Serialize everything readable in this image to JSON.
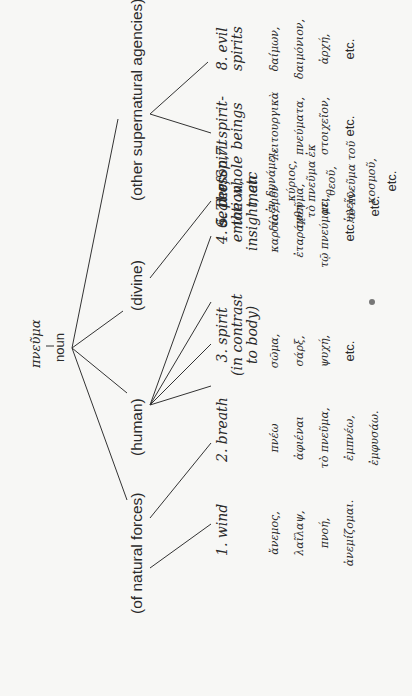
{
  "root": {
    "greek": "πνεῦμα",
    "pos": "noun"
  },
  "groups": [
    {
      "label": "(of natural forces)"
    },
    {
      "label": "(human)"
    },
    {
      "label": "(divine)"
    },
    {
      "label": "(other supernatural agencies)"
    }
  ],
  "categories": [
    {
      "label": "1. wind",
      "words": [
        "ἄνεμος,",
        "λαῖλαψ,",
        "πνοή,",
        "ἀνεμίζομαι."
      ]
    },
    {
      "label": "2. breath",
      "words": [
        "πνέω",
        "ἀφιέναι",
        "τὸ πνεῦμα,",
        "ἐμπνέω,",
        "ἐμφυσάω."
      ]
    },
    {
      "label": "3. spirit (in contrast to body)",
      "lines": [
        "3. spirit",
        "(in contrast",
        "to body)"
      ],
      "words": [
        "σῶμα,",
        "σάρξ,",
        "ψυχή,",
        "etc."
      ]
    },
    {
      "label": "4. seat of emotion, insight, etc",
      "lines": [
        "4. seat of",
        "emotion,",
        "insight, etc"
      ],
      "words": [
        "καρδία,",
        "ἐταράχθη",
        "τῷ πνεύματι,",
        "etc."
      ]
    },
    {
      "label": "5. person, the whole man",
      "lines": [
        "5. person,",
        "the whole",
        "man"
      ],
      "words": [
        "τὸ ἐμὸν",
        "πνεῦμα,",
        "με,",
        "ὑμεῖς,",
        "etc."
      ]
    },
    {
      "label": "6. The Spirit",
      "words": [
        "ἐν δυνάμει,",
        "κύριος,",
        "τὸ πνεῦμα ἐκ θεοῦ,",
        "τὸ πνεῦμα τοῦ κοσμοῦ,",
        "etc."
      ]
    },
    {
      "label": "7. spirit-beings",
      "lines": [
        "7. spirit-",
        "beings"
      ],
      "words": [
        "λειτουργικὰ",
        "πνεύματα,",
        "στοιχεῖον,",
        "etc."
      ]
    },
    {
      "label": "8. evil spirits",
      "lines": [
        "8. evil",
        "spirits"
      ],
      "words": [
        "δαίμων,",
        "δαιμόνιον,",
        "ἀρχή,",
        "etc."
      ]
    }
  ],
  "colors": {
    "ink": "#2a2a2a",
    "paper": "#f7f7f5"
  }
}
